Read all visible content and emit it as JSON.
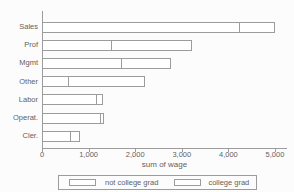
{
  "chart_data": {
    "type": "bar",
    "orientation": "horizontal",
    "stacked": true,
    "title": "",
    "xlabel": "sum of wage",
    "ylabel": "",
    "categories": [
      "Sales",
      "Prof",
      "Mgmt",
      "Other",
      "Labor",
      "Operat.",
      "Cler."
    ],
    "series": [
      {
        "name": "not college grad",
        "values": [
          4250,
          1500,
          1725,
          575,
          1190,
          1275,
          625
        ]
      },
      {
        "name": "college grad",
        "values": [
          750,
          1725,
          1050,
          1640,
          120,
          50,
          195
        ]
      }
    ],
    "totals": [
      5000,
      3225,
      2775,
      2215,
      1310,
      1325,
      820
    ],
    "xlim": [
      0,
      5240
    ],
    "xticks": {
      "values": [
        0,
        1000,
        2000,
        3000,
        4000,
        5000
      ],
      "labels": [
        "0",
        "1,000",
        "2,000",
        "3,000",
        "4,000",
        "5,000"
      ]
    },
    "grid": false,
    "legend_position": "bottom",
    "bar_fill": "#ffffff",
    "bar_border": "#9c9c9c",
    "axis_color": "#9c9c9c",
    "text_color": "#5f5f5f",
    "background": "#fcfcfc"
  }
}
